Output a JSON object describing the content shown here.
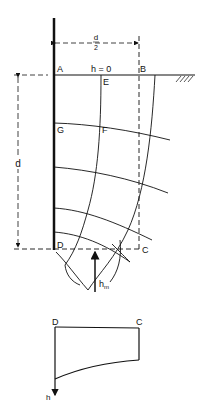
{
  "diagram": {
    "type": "flow-net",
    "points": {
      "A": "A",
      "B": "B",
      "C": "C",
      "D": "D",
      "E": "E",
      "F": "F",
      "G": "G"
    },
    "head_label": "h = 0",
    "half_width_label_num": "d",
    "half_width_label_den": "2",
    "depth_label": "d",
    "max_head_label": "h",
    "max_head_sub": "m",
    "lower_diagram": {
      "left_label": "D",
      "right_label": "C",
      "axis_label": "h"
    }
  }
}
